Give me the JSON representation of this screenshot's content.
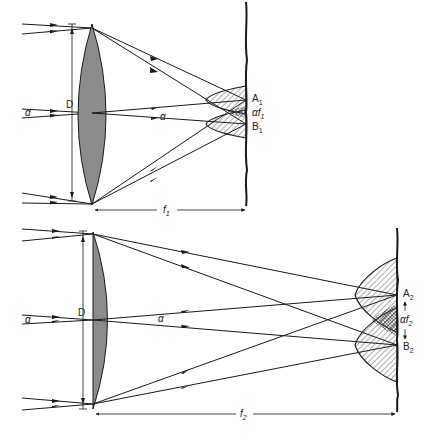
{
  "figure": {
    "colors": {
      "lens_fill": "#8c8c8c",
      "line": "#1a1a1a",
      "background": "#ffffff"
    },
    "top": {
      "aperture_label": "D",
      "incoming_angle_label": "α",
      "outgoing_angle_label": "α",
      "point_a": {
        "main": "A",
        "sub": "1"
      },
      "separation": {
        "main": "αf",
        "sub": "1"
      },
      "point_b": {
        "main": "B",
        "sub": "1"
      },
      "focal_length": {
        "main": "f",
        "sub": "1"
      }
    },
    "bottom": {
      "aperture_label": "D",
      "incoming_angle_label": "α",
      "outgoing_angle_label": "α",
      "point_a": {
        "main": "A",
        "sub": "2"
      },
      "separation": {
        "main": "αf",
        "sub": "2"
      },
      "point_b": {
        "main": "B",
        "sub": "2"
      },
      "focal_length": {
        "main": "f",
        "sub": "2"
      }
    }
  }
}
